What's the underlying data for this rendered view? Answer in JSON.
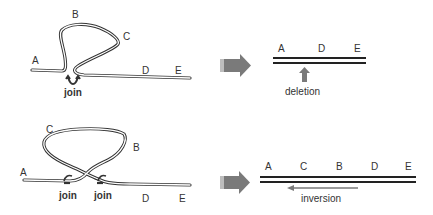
{
  "panels": [
    {
      "id": "deletion",
      "before": {
        "labels": {
          "A": "A",
          "B": "B",
          "C": "C",
          "D": "D",
          "E": "E"
        },
        "join_labels": [
          "join"
        ]
      },
      "after": {
        "labels": [
          "A",
          "D",
          "E"
        ],
        "annotation": "deletion"
      }
    },
    {
      "id": "inversion",
      "before": {
        "labels": {
          "A": "A",
          "B": "B",
          "C": "C",
          "D": "D",
          "E": "E"
        },
        "join_labels": [
          "join",
          "join"
        ]
      },
      "after": {
        "labels": [
          "A",
          "C",
          "B",
          "D",
          "E"
        ],
        "annotation": "inversion"
      }
    }
  ],
  "colors": {
    "strand": "#333333",
    "arrow": "#7a7a7a",
    "text": "#333333"
  }
}
